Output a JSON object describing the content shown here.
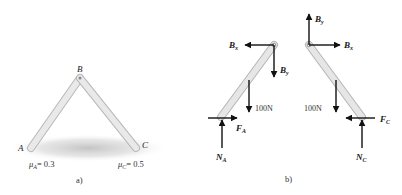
{
  "figure_a": {
    "caption": "a)",
    "points": {
      "A": "A",
      "B": "B",
      "C": "C"
    },
    "friction_A": {
      "symbol": "μ",
      "sub": "A",
      "value": "= 0.3"
    },
    "friction_C": {
      "symbol": "μ",
      "sub": "C",
      "value": "= 0.5"
    }
  },
  "figure_b": {
    "caption": "b)",
    "left_rod": {
      "Bx": {
        "main": "B",
        "sub": "x"
      },
      "By": {
        "main": "B",
        "sub": "y"
      },
      "weight": "100N",
      "friction": {
        "main": "F",
        "sub": "A"
      },
      "normal": {
        "main": "N",
        "sub": "A"
      }
    },
    "right_rod": {
      "By": {
        "main": "B",
        "sub": "y"
      },
      "Bx": {
        "main": "B",
        "sub": "x"
      },
      "weight": "100N",
      "friction": {
        "main": "F",
        "sub": "C"
      },
      "normal": {
        "main": "N",
        "sub": "C"
      }
    }
  },
  "colors": {
    "rod_fill": "#e4e4e4",
    "rod_edge": "#b5b5b5",
    "arrow": "#111111",
    "shadow": "#c8c8c8"
  }
}
